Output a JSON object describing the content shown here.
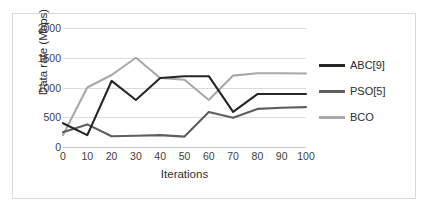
{
  "chart_data": {
    "type": "line",
    "title": "",
    "xlabel": "Iterations",
    "ylabel": "Data rate (Mbps)",
    "x": [
      0,
      10,
      20,
      30,
      40,
      50,
      60,
      70,
      80,
      90,
      100
    ],
    "xticklabels": [
      "0",
      "10",
      "20",
      "30",
      "40",
      "50",
      "60",
      "70",
      "80",
      "90",
      "100"
    ],
    "yticklabels": [
      "0",
      "500",
      "1000",
      "1500",
      "2000"
    ],
    "yticks": [
      0,
      500,
      1000,
      1500,
      2000
    ],
    "xlim": [
      0,
      100
    ],
    "ylim": [
      0,
      2000
    ],
    "grid": true,
    "grid_axis": "y",
    "legend_position": "right",
    "series": [
      {
        "name": "ABC[9]",
        "color": "#262626",
        "values": [
          400,
          200,
          1110,
          790,
          1160,
          1190,
          1190,
          590,
          890,
          890,
          890
        ]
      },
      {
        "name": "PSO[5]",
        "color": "#5e5e5e",
        "values": [
          250,
          380,
          180,
          190,
          200,
          175,
          590,
          490,
          640,
          660,
          670
        ]
      },
      {
        "name": "BCO",
        "color": "#a8a8a8",
        "values": [
          200,
          1000,
          1210,
          1500,
          1160,
          1130,
          790,
          1200,
          1240,
          1240,
          1235
        ]
      }
    ]
  },
  "legend": {
    "items": [
      {
        "label": "ABC[9]",
        "color": "#262626"
      },
      {
        "label": "PSO[5]",
        "color": "#5e5e5e"
      },
      {
        "label": "BCO",
        "color": "#a8a8a8"
      }
    ]
  },
  "axes": {
    "x_title": "Iterations",
    "y_title": "Data rate (Mbps)"
  }
}
